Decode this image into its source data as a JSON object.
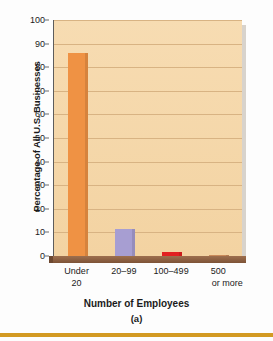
{
  "chart_data": {
    "type": "bar",
    "title": "",
    "subtitle": "",
    "caption": "(a)",
    "xlabel": "Number of Employees",
    "ylabel": "Percentage of All U.S. Businesses",
    "categories": [
      "Under 20",
      "20–99",
      "100–499",
      "500 or more"
    ],
    "category_lines": [
      [
        "Under",
        "20"
      ],
      [
        "20–99",
        ""
      ],
      [
        "100–499",
        ""
      ],
      [
        "500",
        "or more"
      ]
    ],
    "values": [
      86,
      11.3,
      1.6,
      0.3
    ],
    "bar_colors": [
      "#ef9244",
      "#a79ed2",
      "#e22121",
      "#c98a5a"
    ],
    "ylim": [
      0,
      100
    ],
    "ytick_step": 10,
    "yticks": [
      "0",
      "10",
      "20",
      "30",
      "40",
      "50",
      "60",
      "70",
      "80",
      "90",
      "100"
    ],
    "grid": true,
    "legend": "none",
    "plot_background": "#f4d5a4",
    "gridline_color": "#d8b383",
    "axis_color": "#5d5d5d",
    "floor_color": "#8a5f40",
    "rule_color": "#d39a23"
  }
}
